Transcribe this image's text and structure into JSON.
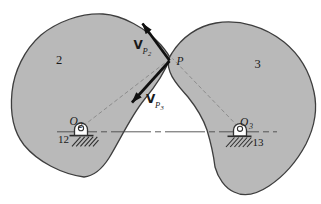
{
  "figure": {
    "colors": {
      "background": "#ffffff",
      "body_fill": "#b9b9b9",
      "body_outline": "#3e3e3e",
      "arrow": "#101010",
      "dashed_line": "#8c8c8c",
      "centerline": "#4a4a4a",
      "hatch": "#2e2e2e",
      "pin_fill": "#ffffff",
      "text": "#1a1a1a"
    },
    "labels": {
      "body2": "2",
      "body3": "3",
      "contact_point": "P",
      "vp2": {
        "main": "V",
        "sub": "P",
        "subsub": "2"
      },
      "vp3": {
        "main": "V",
        "sub": "P",
        "subsub": "3"
      },
      "o2": {
        "main": "O",
        "sub": "2"
      },
      "o3": {
        "main": "O",
        "sub": "3"
      },
      "ground_link_left": "12",
      "ground_link_right": "13"
    }
  }
}
